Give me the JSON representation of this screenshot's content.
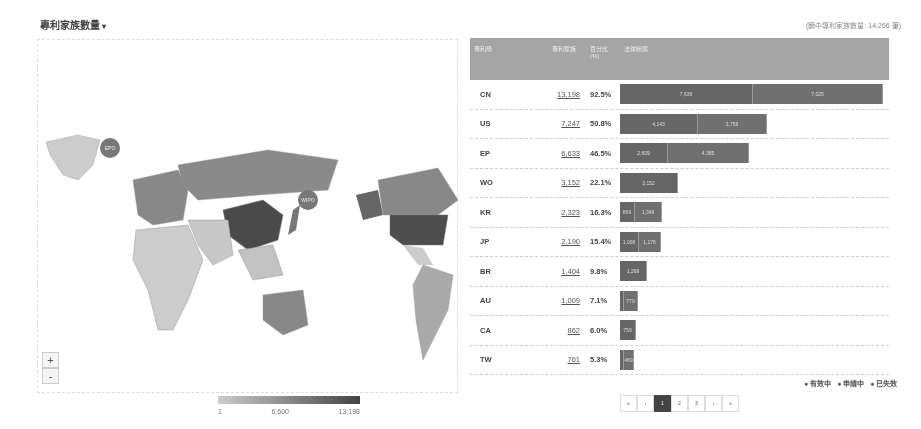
{
  "header": {
    "title": "專利家族數量",
    "caret": "▾",
    "total": "(篩中專利家族數量: 14,266 筆)"
  },
  "map": {
    "zoom_in": "+",
    "zoom_out": "-",
    "markers": [
      {
        "label": "EPO"
      },
      {
        "label": "WIPO"
      }
    ],
    "legend": {
      "min": "1",
      "mid": "6,600",
      "max": "13,198"
    }
  },
  "table": {
    "headers": [
      "專利局",
      "專利家族",
      "百分比(%)",
      "法律狀態"
    ],
    "rows": [
      {
        "code": "CN",
        "count": "13,198",
        "pct": "92.5%",
        "segments": [
          {
            "v": "7,636",
            "w": 133
          },
          {
            "v": "7,025",
            "w": 130
          }
        ]
      },
      {
        "code": "US",
        "count": "7,247",
        "pct": "50.8%",
        "segments": [
          {
            "v": "4,143",
            "w": 78
          },
          {
            "v": "3,758",
            "w": 69
          }
        ]
      },
      {
        "code": "EP",
        "count": "6,633",
        "pct": "46.5%",
        "segments": [
          {
            "v": "2,609",
            "w": 48
          },
          {
            "v": "4,385",
            "w": 81
          }
        ]
      },
      {
        "code": "WO",
        "count": "3,152",
        "pct": "22.1%",
        "segments": [
          {
            "v": "3,152",
            "w": 58
          }
        ]
      },
      {
        "code": "KR",
        "count": "2,323",
        "pct": "16.3%",
        "segments": [
          {
            "v": "869",
            "w": 15
          },
          {
            "v": "1,349",
            "w": 27
          }
        ]
      },
      {
        "code": "JP",
        "count": "2,190",
        "pct": "15.4%",
        "segments": [
          {
            "v": "1,008",
            "w": 19
          },
          {
            "v": "1,176",
            "w": 22
          }
        ]
      },
      {
        "code": "BR",
        "count": "1,404",
        "pct": "9.8%",
        "segments": [
          {
            "v": "1,269",
            "w": 27
          }
        ]
      },
      {
        "code": "AU",
        "count": "1,009",
        "pct": "7.1%",
        "segments": [
          {
            "v": "",
            "w": 4
          },
          {
            "v": "779",
            "w": 14
          }
        ]
      },
      {
        "code": "CA",
        "count": "862",
        "pct": "6.0%",
        "segments": [
          {
            "v": "759",
            "w": 16
          }
        ]
      },
      {
        "code": "TW",
        "count": "761",
        "pct": "5.3%",
        "segments": [
          {
            "v": "",
            "w": 4
          },
          {
            "v": "469",
            "w": 10
          }
        ]
      }
    ]
  },
  "status_legend": [
    "有效中",
    "申請中",
    "已失效"
  ],
  "pagination": [
    "«",
    "‹",
    "1",
    "2",
    "3",
    "›",
    "»"
  ],
  "pagination_active": "1"
}
